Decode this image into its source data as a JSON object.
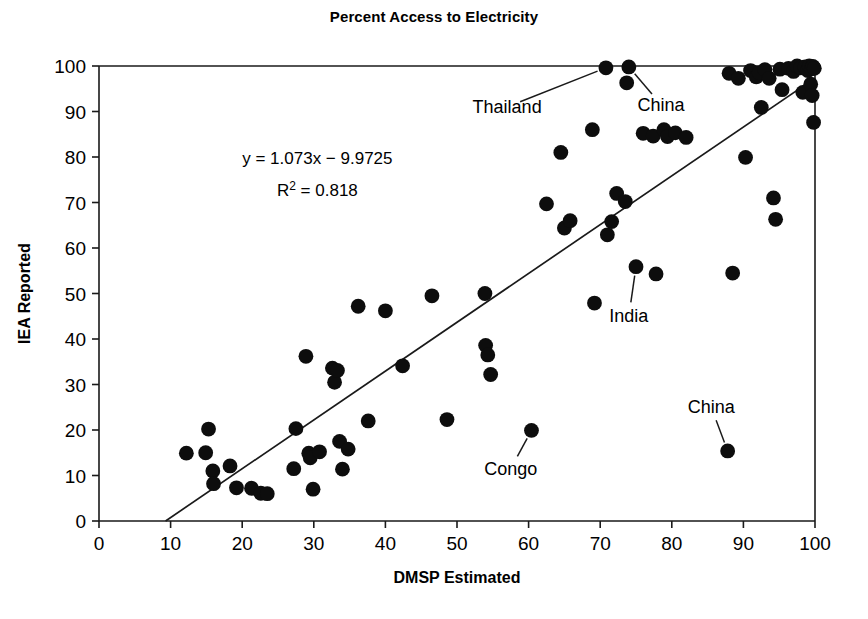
{
  "chart_data": {
    "type": "scatter",
    "title": "Percent Access to Electricity",
    "xlabel": "DMSP Estimated",
    "ylabel": "IEA Reported",
    "xlim": [
      0,
      100
    ],
    "ylim": [
      0,
      100
    ],
    "xticks": [
      0,
      10,
      20,
      30,
      40,
      50,
      60,
      70,
      80,
      90,
      100
    ],
    "yticks": [
      0,
      10,
      20,
      30,
      40,
      50,
      60,
      70,
      80,
      90,
      100
    ],
    "grid": false,
    "legend": "none",
    "equation_line1": "y = 1.073x − 9.9725",
    "equation_line2_prefix": "R",
    "equation_line2_sup": "2",
    "equation_line2_suffix": " = 0.818",
    "fit": {
      "slope": 1.073,
      "intercept": -9.9725,
      "r_squared": 0.818,
      "x_start": 9.3,
      "x_end": 100
    },
    "points": [
      [
        12.2,
        14.9
      ],
      [
        14.9,
        15.0
      ],
      [
        15.3,
        20.2
      ],
      [
        15.9,
        11.0
      ],
      [
        16.0,
        8.2
      ],
      [
        18.3,
        12.1
      ],
      [
        19.2,
        7.3
      ],
      [
        21.3,
        7.2
      ],
      [
        22.6,
        6.1
      ],
      [
        23.5,
        6.0
      ],
      [
        27.2,
        11.5
      ],
      [
        27.5,
        20.3
      ],
      [
        28.9,
        36.2
      ],
      [
        29.3,
        14.9
      ],
      [
        29.5,
        13.9
      ],
      [
        29.9,
        7.0
      ],
      [
        30.8,
        15.2
      ],
      [
        32.6,
        33.6
      ],
      [
        32.9,
        30.5
      ],
      [
        33.3,
        33.1
      ],
      [
        33.6,
        17.5
      ],
      [
        34.0,
        11.4
      ],
      [
        34.8,
        15.8
      ],
      [
        36.2,
        47.2
      ],
      [
        37.6,
        22.0
      ],
      [
        40.0,
        46.2
      ],
      [
        42.4,
        34.1
      ],
      [
        46.5,
        49.5
      ],
      [
        48.6,
        22.3
      ],
      [
        53.9,
        50.0
      ],
      [
        54.0,
        38.6
      ],
      [
        54.3,
        36.5
      ],
      [
        54.7,
        32.2
      ],
      [
        60.4,
        19.9
      ],
      [
        62.5,
        69.7
      ],
      [
        64.5,
        81.0
      ],
      [
        65.0,
        64.4
      ],
      [
        65.8,
        66.0
      ],
      [
        68.9,
        86.0
      ],
      [
        69.2,
        47.9
      ],
      [
        70.8,
        99.6
      ],
      [
        71.0,
        62.9
      ],
      [
        71.6,
        65.8
      ],
      [
        72.3,
        72.0
      ],
      [
        73.5,
        70.2
      ],
      [
        73.7,
        96.3
      ],
      [
        74.0,
        99.8
      ],
      [
        75.0,
        55.9
      ],
      [
        76.0,
        85.2
      ],
      [
        77.4,
        84.6
      ],
      [
        77.8,
        54.3
      ],
      [
        78.9,
        86.0
      ],
      [
        79.4,
        84.5
      ],
      [
        80.5,
        85.3
      ],
      [
        82.0,
        84.3
      ],
      [
        87.8,
        15.4
      ],
      [
        88.0,
        98.4
      ],
      [
        88.5,
        54.5
      ],
      [
        89.3,
        97.3
      ],
      [
        90.3,
        79.9
      ],
      [
        91.0,
        99.0
      ],
      [
        91.8,
        97.6
      ],
      [
        92.2,
        98.5
      ],
      [
        92.5,
        90.9
      ],
      [
        93.0,
        99.2
      ],
      [
        93.6,
        97.3
      ],
      [
        94.2,
        71.0
      ],
      [
        94.5,
        66.3
      ],
      [
        95.1,
        99.3
      ],
      [
        95.4,
        94.8
      ],
      [
        96.3,
        99.5
      ],
      [
        97.0,
        98.8
      ],
      [
        97.5,
        100.0
      ],
      [
        98.0,
        99.6
      ],
      [
        98.3,
        94.2
      ],
      [
        98.6,
        99.8
      ],
      [
        99.0,
        99.0
      ],
      [
        99.2,
        100.0
      ],
      [
        99.4,
        96.0
      ],
      [
        99.5,
        99.4
      ],
      [
        99.6,
        93.5
      ],
      [
        99.7,
        99.9
      ],
      [
        99.8,
        87.6
      ],
      [
        99.9,
        99.5
      ]
    ],
    "annotations": [
      {
        "label": "Thailand",
        "point_x": 70.8,
        "point_y": 99.6,
        "text_x": 57.0,
        "text_y": 91.0
      },
      {
        "label": "China",
        "point_x": 74.0,
        "point_y": 99.8,
        "text_x": 78.5,
        "text_y": 91.5
      },
      {
        "label": "India",
        "point_x": 75.0,
        "point_y": 55.9,
        "text_x": 74.0,
        "text_y": 45.0
      },
      {
        "label": "Congo",
        "point_x": 60.4,
        "point_y": 19.9,
        "text_x": 57.5,
        "text_y": 11.5
      },
      {
        "label": "China",
        "point_x": 87.8,
        "point_y": 15.4,
        "text_x": 85.5,
        "text_y": 25.0
      }
    ]
  }
}
